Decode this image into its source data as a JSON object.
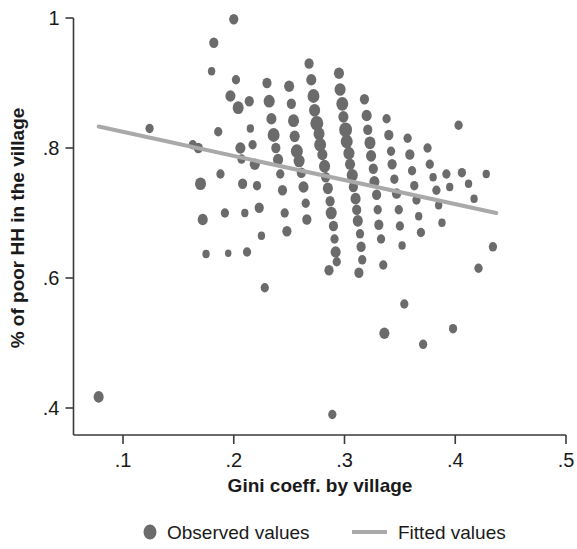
{
  "chart_data": {
    "type": "scatter",
    "title": "",
    "subtitle": "",
    "xlabel": "Gini coeff. by village",
    "ylabel": "% of poor HH in the village",
    "xlim": [
      0.05,
      0.5
    ],
    "ylim": [
      0.36,
      1.02
    ],
    "xticks": [
      0.1,
      0.2,
      0.3,
      0.4,
      0.5
    ],
    "xticklabels": [
      ".1",
      ".2",
      ".3",
      ".4",
      ".5"
    ],
    "yticks": [
      0.4,
      0.6,
      0.8,
      1.0
    ],
    "yticklabels": [
      ".4",
      ".6",
      ".8",
      "1"
    ],
    "grid": false,
    "legend_position": "bottom",
    "legend": [
      {
        "label": "Observed values",
        "marker": "circle",
        "color": "#6b6b6b"
      },
      {
        "label": "Fitted values",
        "marker": "line",
        "color": "#a9a9a9"
      }
    ],
    "series": [
      {
        "name": "Observed values",
        "type": "scatter",
        "marker": "circle",
        "color": "#6b6b6b",
        "note": "bubble sizes vary by village population weight",
        "points": [
          [
            0.078,
            0.417,
            11
          ],
          [
            0.124,
            0.83,
            9
          ],
          [
            0.163,
            0.805,
            9
          ],
          [
            0.168,
            0.8,
            10
          ],
          [
            0.17,
            0.745,
            12
          ],
          [
            0.172,
            0.69,
            11
          ],
          [
            0.175,
            0.637,
            8
          ],
          [
            0.18,
            0.918,
            8
          ],
          [
            0.182,
            0.962,
            10
          ],
          [
            0.186,
            0.825,
            9
          ],
          [
            0.188,
            0.76,
            9
          ],
          [
            0.192,
            0.7,
            9
          ],
          [
            0.195,
            0.638,
            7
          ],
          [
            0.197,
            0.88,
            11
          ],
          [
            0.2,
            0.998,
            10
          ],
          [
            0.202,
            0.905,
            9
          ],
          [
            0.204,
            0.862,
            12
          ],
          [
            0.206,
            0.8,
            11
          ],
          [
            0.207,
            0.783,
            9
          ],
          [
            0.208,
            0.745,
            10
          ],
          [
            0.21,
            0.7,
            8
          ],
          [
            0.212,
            0.64,
            9
          ],
          [
            0.214,
            0.872,
            10
          ],
          [
            0.215,
            0.83,
            8
          ],
          [
            0.217,
            0.805,
            9
          ],
          [
            0.219,
            0.775,
            11
          ],
          [
            0.221,
            0.742,
            9
          ],
          [
            0.223,
            0.708,
            10
          ],
          [
            0.225,
            0.665,
            8
          ],
          [
            0.228,
            0.585,
            9
          ],
          [
            0.23,
            0.9,
            10
          ],
          [
            0.232,
            0.872,
            12
          ],
          [
            0.234,
            0.845,
            11
          ],
          [
            0.236,
            0.82,
            13
          ],
          [
            0.238,
            0.8,
            10
          ],
          [
            0.24,
            0.782,
            11
          ],
          [
            0.242,
            0.76,
            9
          ],
          [
            0.244,
            0.735,
            10
          ],
          [
            0.246,
            0.7,
            9
          ],
          [
            0.248,
            0.672,
            10
          ],
          [
            0.25,
            0.895,
            11
          ],
          [
            0.252,
            0.868,
            10
          ],
          [
            0.254,
            0.842,
            12
          ],
          [
            0.255,
            0.818,
            11
          ],
          [
            0.257,
            0.795,
            13
          ],
          [
            0.259,
            0.78,
            12
          ],
          [
            0.261,
            0.762,
            10
          ],
          [
            0.263,
            0.74,
            11
          ],
          [
            0.265,
            0.715,
            9
          ],
          [
            0.266,
            0.69,
            10
          ],
          [
            0.268,
            0.93,
            10
          ],
          [
            0.27,
            0.905,
            11
          ],
          [
            0.272,
            0.88,
            13
          ],
          [
            0.273,
            0.858,
            12
          ],
          [
            0.275,
            0.838,
            14
          ],
          [
            0.277,
            0.822,
            12
          ],
          [
            0.278,
            0.805,
            13
          ],
          [
            0.28,
            0.79,
            11
          ],
          [
            0.282,
            0.772,
            12
          ],
          [
            0.283,
            0.755,
            10
          ],
          [
            0.285,
            0.738,
            11
          ],
          [
            0.287,
            0.718,
            10
          ],
          [
            0.288,
            0.7,
            12
          ],
          [
            0.29,
            0.68,
            10
          ],
          [
            0.291,
            0.66,
            9
          ],
          [
            0.292,
            0.64,
            11
          ],
          [
            0.293,
            0.625,
            9
          ],
          [
            0.286,
            0.612,
            10
          ],
          [
            0.289,
            0.39,
            9
          ],
          [
            0.295,
            0.915,
            11
          ],
          [
            0.296,
            0.89,
            12
          ],
          [
            0.298,
            0.868,
            13
          ],
          [
            0.299,
            0.848,
            11
          ],
          [
            0.301,
            0.828,
            14
          ],
          [
            0.302,
            0.81,
            13
          ],
          [
            0.304,
            0.792,
            12
          ],
          [
            0.305,
            0.775,
            11
          ],
          [
            0.307,
            0.758,
            12
          ],
          [
            0.308,
            0.74,
            10
          ],
          [
            0.31,
            0.722,
            11
          ],
          [
            0.311,
            0.705,
            10
          ],
          [
            0.312,
            0.688,
            11
          ],
          [
            0.314,
            0.668,
            9
          ],
          [
            0.315,
            0.648,
            10
          ],
          [
            0.316,
            0.628,
            9
          ],
          [
            0.313,
            0.608,
            10
          ],
          [
            0.318,
            0.875,
            10
          ],
          [
            0.32,
            0.85,
            11
          ],
          [
            0.321,
            0.828,
            10
          ],
          [
            0.323,
            0.808,
            12
          ],
          [
            0.324,
            0.788,
            11
          ],
          [
            0.326,
            0.768,
            10
          ],
          [
            0.327,
            0.748,
            11
          ],
          [
            0.329,
            0.728,
            10
          ],
          [
            0.33,
            0.705,
            9
          ],
          [
            0.331,
            0.682,
            10
          ],
          [
            0.333,
            0.66,
            9
          ],
          [
            0.335,
            0.62,
            9
          ],
          [
            0.336,
            0.515,
            11
          ],
          [
            0.338,
            0.845,
            9
          ],
          [
            0.34,
            0.82,
            10
          ],
          [
            0.342,
            0.795,
            9
          ],
          [
            0.343,
            0.775,
            10
          ],
          [
            0.345,
            0.752,
            9
          ],
          [
            0.347,
            0.73,
            10
          ],
          [
            0.349,
            0.705,
            9
          ],
          [
            0.35,
            0.68,
            9
          ],
          [
            0.352,
            0.65,
            8
          ],
          [
            0.354,
            0.56,
            9
          ],
          [
            0.357,
            0.815,
            9
          ],
          [
            0.359,
            0.79,
            10
          ],
          [
            0.361,
            0.765,
            9
          ],
          [
            0.363,
            0.742,
            9
          ],
          [
            0.365,
            0.72,
            9
          ],
          [
            0.367,
            0.695,
            8
          ],
          [
            0.369,
            0.67,
            9
          ],
          [
            0.371,
            0.498,
            9
          ],
          [
            0.375,
            0.8,
            9
          ],
          [
            0.377,
            0.775,
            9
          ],
          [
            0.38,
            0.755,
            8
          ],
          [
            0.383,
            0.735,
            9
          ],
          [
            0.385,
            0.712,
            8
          ],
          [
            0.388,
            0.685,
            8
          ],
          [
            0.392,
            0.76,
            9
          ],
          [
            0.395,
            0.74,
            8
          ],
          [
            0.398,
            0.522,
            9
          ],
          [
            0.403,
            0.835,
            9
          ],
          [
            0.406,
            0.762,
            9
          ],
          [
            0.412,
            0.745,
            8
          ],
          [
            0.417,
            0.722,
            8
          ],
          [
            0.421,
            0.615,
            9
          ],
          [
            0.428,
            0.76,
            8
          ],
          [
            0.434,
            0.648,
            9
          ]
        ]
      },
      {
        "name": "Fitted values",
        "type": "line",
        "color": "#a9a9a9",
        "endpoints": [
          [
            0.078,
            0.833
          ],
          [
            0.437,
            0.7
          ]
        ],
        "slope": -0.37,
        "intercept": 0.862
      }
    ]
  }
}
